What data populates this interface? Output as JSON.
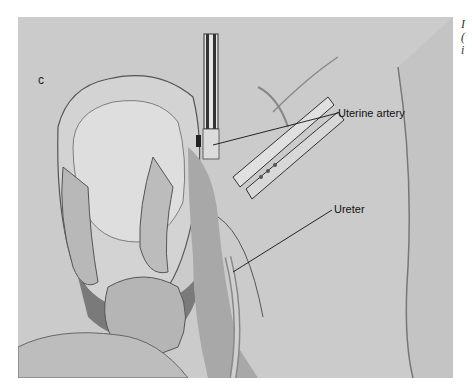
{
  "figure": {
    "panel_letter": "c",
    "labels": [
      {
        "id": "uterine-artery",
        "text": "Uterine artery"
      },
      {
        "id": "ureter",
        "text": "Ureter"
      }
    ],
    "background_color": "#c9c9c9"
  },
  "side_text": {
    "lines": [
      "I",
      "(",
      "i"
    ]
  }
}
